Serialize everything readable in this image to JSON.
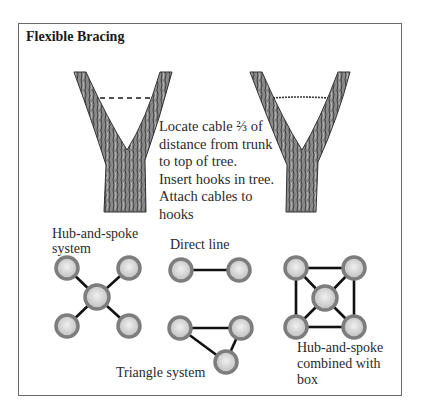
{
  "title": "Flexible Bracing",
  "instructions": {
    "lines": [
      "Locate cable ⅔ of",
      "distance from trunk",
      "to top of tree.",
      "Insert hooks in tree.",
      "Attach cables to",
      "hooks"
    ]
  },
  "trees": [
    {
      "name": "tree-before-cabling",
      "cable": "dashed-line-marker"
    },
    {
      "name": "tree-with-cable",
      "cable": "installed-cable"
    }
  ],
  "systems": {
    "hub_spoke": {
      "label_lines": [
        "Hub-and-spoke",
        "system"
      ]
    },
    "direct_line": {
      "label": "Direct line"
    },
    "triangle": {
      "label": "Triangle system"
    },
    "hub_spoke_box": {
      "label_lines": [
        "Hub-and-spoke",
        "combined with",
        "box"
      ]
    }
  },
  "colors": {
    "frame": "#6a6a6a",
    "bark": "#7a7a7a",
    "bark_dark": "#3c3c3c",
    "node_ring": "#7d7d7d",
    "node_fill": "#d8d8d8",
    "cable": "#1a1a1a"
  }
}
